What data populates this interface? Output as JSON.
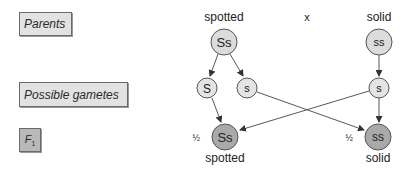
{
  "row_labels": {
    "parents": "Parents",
    "gametes": "Possible gametes",
    "f1_main": "F",
    "f1_sub": "1"
  },
  "parents": {
    "left": {
      "phenotype": "spotted",
      "genotype": "Ss"
    },
    "cross_symbol": "x",
    "right": {
      "phenotype": "solid",
      "genotype": "ss"
    }
  },
  "gametes": [
    {
      "allele": "S",
      "from": "left"
    },
    {
      "allele": "s",
      "from": "left"
    },
    {
      "allele": "s",
      "from": "right"
    }
  ],
  "offspring": [
    {
      "fraction": "1/2",
      "genotype": "Ss",
      "phenotype": "spotted"
    },
    {
      "fraction": "1/2",
      "genotype": "ss",
      "phenotype": "solid"
    }
  ],
  "colors": {
    "parent_fill": "#dcdcdc",
    "gamete_fill": "#e4e4e4",
    "offspring_fill": "#a9a9a9",
    "stroke": "#555555",
    "label_box_fill": "#e2e2e2",
    "f1_box_fill": "#b9b9b9"
  }
}
